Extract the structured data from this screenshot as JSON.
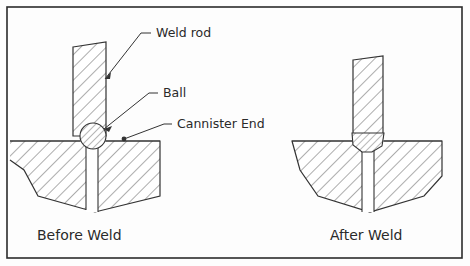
{
  "figure": {
    "border_color": "#2b2b2b",
    "line_color": "#333333",
    "hatch_color": "#4a4a4a",
    "background": "#fdfdfd",
    "text_color": "#2a2a2a"
  },
  "annotations": {
    "weld_rod": "Weld rod",
    "ball": "Ball",
    "cannister_end": "Cannister End"
  },
  "captions": {
    "before": "Before Weld",
    "after": "After Weld"
  },
  "panels": [
    {
      "id": "before-weld",
      "caption": "Before Weld",
      "parts": [
        "weld-rod",
        "ball",
        "cannister-end",
        "channel"
      ]
    },
    {
      "id": "after-weld",
      "caption": "After Weld",
      "parts": [
        "weld-rod",
        "weld-bead",
        "cannister-end",
        "channel"
      ]
    }
  ]
}
